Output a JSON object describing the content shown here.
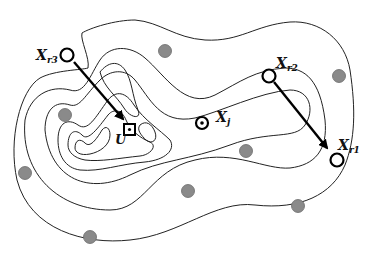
{
  "diagram": {
    "type": "contour-map-with-points",
    "labels": {
      "xr1": {
        "main": "X",
        "sub": "r1"
      },
      "xr2": {
        "main": "X",
        "sub": "r2"
      },
      "xr3": {
        "main": "X",
        "sub": "r3"
      },
      "xj": {
        "main": "X",
        "sub": "j"
      },
      "u": {
        "main": "U"
      }
    },
    "colors": {
      "contour": "#222222",
      "arrow": "#000000",
      "sample_fill": "#8a8a8a",
      "background": "#ffffff"
    },
    "points": {
      "reference_points": [
        "X_r1",
        "X_r2",
        "X_r3"
      ],
      "target_point": "X_j",
      "center_point": "U",
      "gray_samples_count": 9
    },
    "arrows": [
      {
        "from": "X_r3",
        "to": "U"
      },
      {
        "from": "X_r2",
        "to": "X_r1"
      }
    ]
  }
}
